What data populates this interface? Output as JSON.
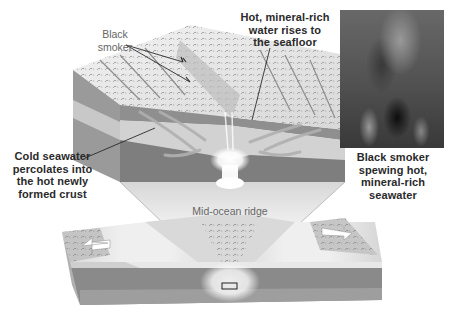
{
  "labels": {
    "black_smoker": [
      "Black",
      "smoker"
    ],
    "hot_water": [
      "Hot, mineral-rich",
      "water rises to",
      "the seafloor"
    ],
    "cold_seawater": [
      "Cold seawater",
      "percolates into",
      "the hot newly",
      "formed crust"
    ],
    "photo_caption": [
      "Black smoker",
      "spewing hot,",
      "mineral-rich",
      "seawater"
    ],
    "mid_ocean_ridge": "Mid-ocean ridge"
  },
  "colors": {
    "background": "#ffffff",
    "seafloor_top": "#e6e6e6",
    "crust_layer": "#8a8a8a",
    "mantle_layer": "#cfcfcf",
    "deep_layer": "#7c7c7c",
    "magma_glow": "#ffffff",
    "label_text": "#2a2a2a",
    "ridge_label": "#666666"
  },
  "icons": {
    "spreading_arrow_left": "left-arrow",
    "spreading_arrow_right": "right-arrow"
  }
}
